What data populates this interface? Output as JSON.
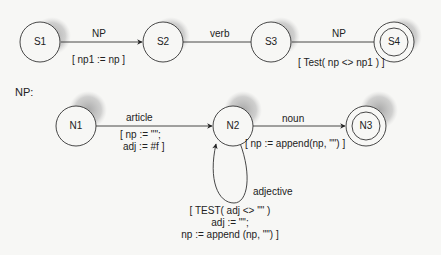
{
  "sentence_network": {
    "nodes": [
      {
        "id": "S1",
        "label": "S1",
        "final": false
      },
      {
        "id": "S2",
        "label": "S2",
        "final": false
      },
      {
        "id": "S3",
        "label": "S3",
        "final": false
      },
      {
        "id": "S4",
        "label": "S4",
        "final": true
      }
    ],
    "edges": [
      {
        "from": "S1",
        "to": "S2",
        "label": "NP",
        "action": "[ np1 := np ]"
      },
      {
        "from": "S2",
        "to": "S3",
        "label": "verb",
        "action": ""
      },
      {
        "from": "S3",
        "to": "S4",
        "label": "NP",
        "action": "[ Test( np <> np1 ) ]"
      }
    ]
  },
  "np_network": {
    "title": "NP:",
    "nodes": [
      {
        "id": "N1",
        "label": "N1",
        "final": false
      },
      {
        "id": "N2",
        "label": "N2",
        "final": false
      },
      {
        "id": "N3",
        "label": "N3",
        "final": true
      }
    ],
    "edges": [
      {
        "from": "N1",
        "to": "N2",
        "label": "article",
        "action_line1": "[ np := \"\";",
        "action_line2": "adj := #f ]"
      },
      {
        "from": "N2",
        "to": "N3",
        "label": "noun",
        "action": "[ np := append(np, \"\") ]"
      },
      {
        "from": "N2",
        "to": "N2",
        "label": "adjective",
        "action_line1": "[ TEST( adj <> \"\" )",
        "action_line2": "adj := \"\";",
        "action_line3": "np := append (np, \"\") ]"
      }
    ]
  },
  "colors": {
    "background": "#f7f7f5",
    "stroke": "#333333",
    "shadow": "#bdbdbd"
  }
}
